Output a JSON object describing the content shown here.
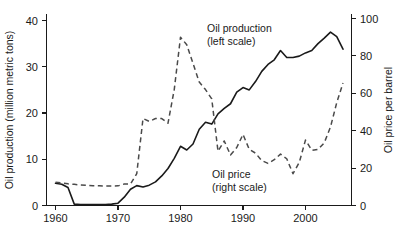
{
  "chart_data": {
    "type": "line",
    "title": "",
    "xlabel": "",
    "ylabel": "Oil production (million metric tons)",
    "y2label": "Oil price per barrel",
    "xlim": [
      1959,
      2007
    ],
    "ylim": [
      0,
      42
    ],
    "y2lim": [
      0,
      105
    ],
    "grid": false,
    "legend_position": "inline-annotations",
    "xticks": [
      "1960",
      "1970",
      "1980",
      "1990",
      "2000"
    ],
    "xtick_values": [
      1960,
      1970,
      1980,
      1990,
      2000
    ],
    "yticks": [
      "0",
      "10",
      "20",
      "30",
      "40"
    ],
    "ytick_values": [
      0,
      10,
      20,
      30,
      40
    ],
    "y2ticks": [
      "0",
      "20",
      "40",
      "60",
      "80",
      "100"
    ],
    "y2tick_values": [
      0,
      20,
      40,
      60,
      80,
      100
    ],
    "annotations": [
      {
        "name": "oil-production-annotation",
        "line1": "Oil production",
        "line2": "(left scale)",
        "x": 1986.5,
        "y": 38.5
      },
      {
        "name": "oil-price-annotation",
        "line1": "Oil price",
        "line2": "(right scale)",
        "x": 1985.5,
        "y": 12.0
      }
    ],
    "series": [
      {
        "name": "Oil production (left scale)",
        "style": "solid",
        "axis": "left",
        "units": "million metric tons",
        "x": [
          1960,
          1961,
          1962,
          1963,
          1964,
          1965,
          1966,
          1967,
          1968,
          1969,
          1970,
          1971,
          1972,
          1973,
          1974,
          1975,
          1976,
          1977,
          1978,
          1979,
          1980,
          1981,
          1982,
          1983,
          1984,
          1985,
          1986,
          1987,
          1988,
          1989,
          1990,
          1991,
          1992,
          1993,
          1994,
          1995,
          1996,
          1997,
          1998,
          1999,
          2000,
          2001,
          2002,
          2003,
          2004,
          2005,
          2006
        ],
        "values": [
          4.8,
          4.6,
          3.9,
          0.3,
          0.2,
          0.2,
          0.2,
          0.2,
          0.2,
          0.3,
          0.5,
          1.8,
          3.5,
          4.3,
          4.0,
          4.4,
          5.1,
          6.4,
          8.0,
          10.2,
          12.8,
          12.0,
          13.3,
          16.5,
          18.0,
          17.6,
          19.8,
          21.0,
          22.0,
          24.5,
          25.5,
          25.0,
          26.8,
          29.0,
          30.5,
          31.5,
          33.5,
          32.0,
          32.0,
          32.3,
          33.0,
          33.5,
          35.0,
          36.2,
          37.5,
          36.5,
          33.8
        ]
      },
      {
        "name": "Oil price (right scale)",
        "style": "dashed",
        "axis": "right",
        "units": "US dollars per barrel",
        "x": [
          1960,
          1961,
          1962,
          1963,
          1964,
          1965,
          1966,
          1967,
          1968,
          1969,
          1970,
          1971,
          1972,
          1973,
          1974,
          1975,
          1976,
          1977,
          1978,
          1979,
          1980,
          1981,
          1982,
          1983,
          1984,
          1985,
          1986,
          1987,
          1988,
          1989,
          1990,
          1991,
          1992,
          1993,
          1994,
          1995,
          1996,
          1997,
          1998,
          1999,
          2000,
          2001,
          2002,
          2003,
          2004,
          2005,
          2006
        ],
        "values": [
          12.5,
          12.0,
          11.6,
          11.3,
          11.0,
          10.8,
          10.6,
          10.5,
          10.4,
          10.4,
          10.5,
          11.5,
          11.5,
          17.0,
          46.5,
          45.0,
          46.5,
          46.5,
          44.0,
          62.0,
          90.0,
          86.0,
          76.0,
          66.0,
          62.0,
          57.0,
          29.0,
          34.5,
          27.0,
          31.0,
          38.0,
          30.0,
          28.0,
          24.0,
          22.5,
          24.5,
          27.5,
          25.0,
          17.0,
          23.0,
          35.0,
          29.5,
          30.0,
          33.5,
          42.0,
          55.0,
          65.5
        ]
      }
    ]
  },
  "figure": {
    "left_axis_title": "Oil production (million metric tons)",
    "right_axis_title": "Oil price per barrel"
  }
}
